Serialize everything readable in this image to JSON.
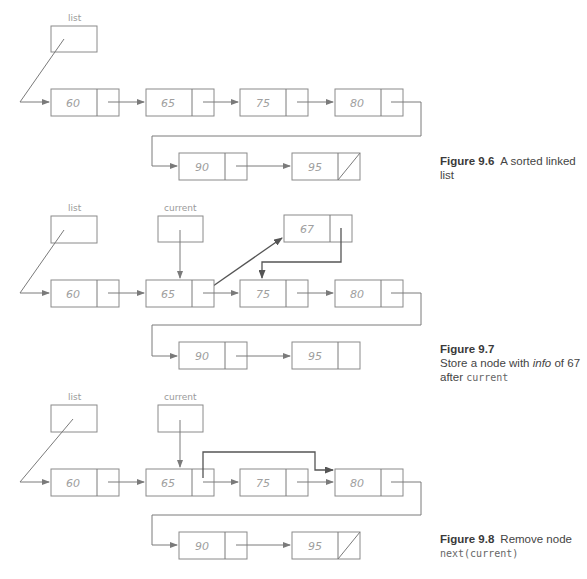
{
  "figures": [
    {
      "id": "9.6",
      "label": "Figure 9.6",
      "caption_text": "A sorted linked list",
      "pointers": [
        {
          "name": "list"
        }
      ],
      "nodes_row1": [
        "60",
        "65",
        "75",
        "80"
      ],
      "nodes_row2": [
        "90",
        "95"
      ],
      "last_next": "null"
    },
    {
      "id": "9.7",
      "label": "Figure 9.7",
      "caption_line1": "Store a node with ",
      "caption_info": "info",
      "caption_line1b": " of 67",
      "caption_line2": "after ",
      "caption_code": "current",
      "pointers": [
        {
          "name": "list"
        },
        {
          "name": "current"
        }
      ],
      "nodes_row1": [
        "60",
        "65",
        "75",
        "80"
      ],
      "inserted_node": "67",
      "nodes_row2": [
        "90",
        "95"
      ]
    },
    {
      "id": "9.8",
      "label": "Figure 9.8",
      "caption_text": "Remove node",
      "caption_code": "next(current)",
      "pointers": [
        {
          "name": "list"
        },
        {
          "name": "current"
        }
      ],
      "nodes_row1": [
        "60",
        "65",
        "75",
        "80"
      ],
      "nodes_row2": [
        "90",
        "95"
      ],
      "last_next": "null"
    }
  ],
  "colors": {
    "box_stroke": "#8a8a8a",
    "arrow": "#7a7a7a",
    "text_value": "#a0a0a0",
    "caption": "#444444"
  }
}
